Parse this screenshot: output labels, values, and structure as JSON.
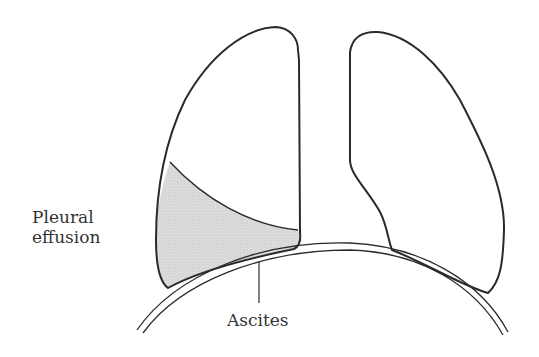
{
  "figure": {
    "type": "anatomical-line-drawing"
  },
  "labels": {
    "pleural_effusion_line1": "Pleural",
    "pleural_effusion_line2": "effusion",
    "ascites": "Ascites"
  },
  "colors": {
    "outline": "#2a2a2a",
    "effusion_fill": "#d9d9d9",
    "background": "#ffffff",
    "text": "#333333"
  }
}
